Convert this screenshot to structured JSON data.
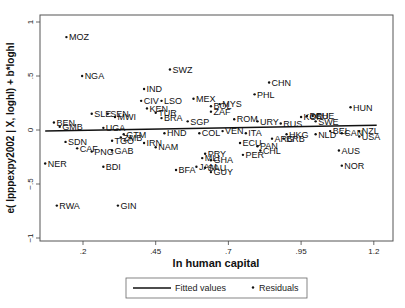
{
  "chart_data": {
    "type": "scatter",
    "title": "",
    "xlabel": "ln human capital",
    "ylabel": "e( lpppexpy2002 | X, loghl) + b*loghl",
    "xlim": [
      0.07,
      1.28
    ],
    "ylim": [
      -1.03,
      1.07
    ],
    "xticks": [
      0.2,
      0.45,
      0.7,
      0.95,
      1.2
    ],
    "xtick_labels": [
      ".2",
      ".45",
      ".7",
      ".95",
      "1.2"
    ],
    "yticks": [
      1,
      0.5,
      0,
      -0.5,
      -1
    ],
    "ytick_labels": [
      "1",
      ".5",
      "0",
      "−.5",
      "−1"
    ],
    "grid": false,
    "legend_position": "bottom",
    "legend": [
      {
        "name": "Fitted values",
        "marker": "line"
      },
      {
        "name": "Residuals",
        "marker": "dot"
      }
    ],
    "fitted_line": {
      "x": [
        0.07,
        1.21
      ],
      "y": [
        -0.01,
        0.045
      ]
    },
    "series": [
      {
        "name": "Residuals",
        "points": [
          {
            "label": "MOZ",
            "x": 0.143,
            "y": 0.86
          },
          {
            "label": "NGA",
            "x": 0.197,
            "y": 0.5
          },
          {
            "label": "SWZ",
            "x": 0.499,
            "y": 0.56
          },
          {
            "label": "IND",
            "x": 0.41,
            "y": 0.38
          },
          {
            "label": "CIV",
            "x": 0.4,
            "y": 0.27
          },
          {
            "label": "LSO",
            "x": 0.47,
            "y": 0.27
          },
          {
            "label": "MEX",
            "x": 0.58,
            "y": 0.29
          },
          {
            "label": "CHN",
            "x": 0.84,
            "y": 0.44
          },
          {
            "label": "PHL",
            "x": 0.79,
            "y": 0.33
          },
          {
            "label": "MYS",
            "x": 0.67,
            "y": 0.24
          },
          {
            "label": "BOL",
            "x": 0.64,
            "y": 0.22
          },
          {
            "label": "ZAF",
            "x": 0.64,
            "y": 0.17
          },
          {
            "label": "KEN",
            "x": 0.42,
            "y": 0.2
          },
          {
            "label": "TUR",
            "x": 0.45,
            "y": 0.16
          },
          {
            "label": "SLE",
            "x": 0.23,
            "y": 0.15
          },
          {
            "label": "SEN",
            "x": 0.285,
            "y": 0.15
          },
          {
            "label": "MWI",
            "x": 0.31,
            "y": 0.12
          },
          {
            "label": "BRA",
            "x": 0.47,
            "y": 0.11
          },
          {
            "label": "SGP",
            "x": 0.56,
            "y": 0.08
          },
          {
            "label": "ROM",
            "x": 0.72,
            "y": 0.1
          },
          {
            "label": "URY",
            "x": 0.8,
            "y": 0.08
          },
          {
            "label": "RUS",
            "x": 0.88,
            "y": 0.06
          },
          {
            "label": "KOR",
            "x": 0.95,
            "y": 0.12
          },
          {
            "label": "DEU",
            "x": 0.97,
            "y": 0.13
          },
          {
            "label": "CHE",
            "x": 0.99,
            "y": 0.13
          },
          {
            "label": "SWE",
            "x": 1.0,
            "y": 0.08
          },
          {
            "label": "HUN",
            "x": 1.12,
            "y": 0.21
          },
          {
            "label": "BEN",
            "x": 0.1,
            "y": 0.07
          },
          {
            "label": "GMB",
            "x": 0.12,
            "y": 0.03
          },
          {
            "label": "UGA",
            "x": 0.27,
            "y": 0.02
          },
          {
            "label": "GTM",
            "x": 0.34,
            "y": -0.04
          },
          {
            "label": "ZMB",
            "x": 0.33,
            "y": -0.07
          },
          {
            "label": "TGO",
            "x": 0.3,
            "y": -0.1
          },
          {
            "label": "HND",
            "x": 0.48,
            "y": -0.03
          },
          {
            "label": "COL",
            "x": 0.6,
            "y": -0.03
          },
          {
            "label": "VEN",
            "x": 0.68,
            "y": -0.01
          },
          {
            "label": "ITA",
            "x": 0.76,
            "y": -0.03
          },
          {
            "label": "ECU",
            "x": 0.74,
            "y": -0.12
          },
          {
            "label": "PAN",
            "x": 0.8,
            "y": -0.15
          },
          {
            "label": "CHL",
            "x": 0.81,
            "y": -0.19
          },
          {
            "label": "ARG",
            "x": 0.85,
            "y": -0.08
          },
          {
            "label": "HKG",
            "x": 0.9,
            "y": -0.04
          },
          {
            "label": "BRB",
            "x": 0.89,
            "y": -0.08
          },
          {
            "label": "NLD",
            "x": 1.0,
            "y": -0.04
          },
          {
            "label": "BEL",
            "x": 1.05,
            "y": -0.01
          },
          {
            "label": "CAN",
            "x": 1.09,
            "y": -0.03
          },
          {
            "label": "NZL",
            "x": 1.15,
            "y": -0.01
          },
          {
            "label": "USA",
            "x": 1.15,
            "y": -0.06
          },
          {
            "label": "SDN",
            "x": 0.14,
            "y": -0.11
          },
          {
            "label": "CAF",
            "x": 0.18,
            "y": -0.17
          },
          {
            "label": "PNG",
            "x": 0.23,
            "y": -0.2
          },
          {
            "label": "GAB",
            "x": 0.3,
            "y": -0.19
          },
          {
            "label": "NER",
            "x": 0.07,
            "y": -0.31
          },
          {
            "label": "IRN",
            "x": 0.41,
            "y": -0.12
          },
          {
            "label": "NAM",
            "x": 0.45,
            "y": -0.16
          },
          {
            "label": "BDI",
            "x": 0.27,
            "y": -0.34
          },
          {
            "label": "PRY",
            "x": 0.62,
            "y": -0.22
          },
          {
            "label": "MLI",
            "x": 0.61,
            "y": -0.26
          },
          {
            "label": "GHA",
            "x": 0.64,
            "y": -0.28
          },
          {
            "label": "PER",
            "x": 0.75,
            "y": -0.23
          },
          {
            "label": "JAM",
            "x": 0.59,
            "y": -0.34
          },
          {
            "label": "SAU",
            "x": 0.62,
            "y": -0.35
          },
          {
            "label": "GUY",
            "x": 0.64,
            "y": -0.39
          },
          {
            "label": "BFA",
            "x": 0.52,
            "y": -0.37
          },
          {
            "label": "AUS",
            "x": 1.08,
            "y": -0.19
          },
          {
            "label": "NOR",
            "x": 1.09,
            "y": -0.33
          },
          {
            "label": "RWA",
            "x": 0.11,
            "y": -0.7
          },
          {
            "label": "GIN",
            "x": 0.32,
            "y": -0.7
          }
        ]
      }
    ]
  },
  "colors": {
    "background": "#ffffff",
    "frame": "#444444",
    "points": "#111111",
    "line": "#111111"
  }
}
